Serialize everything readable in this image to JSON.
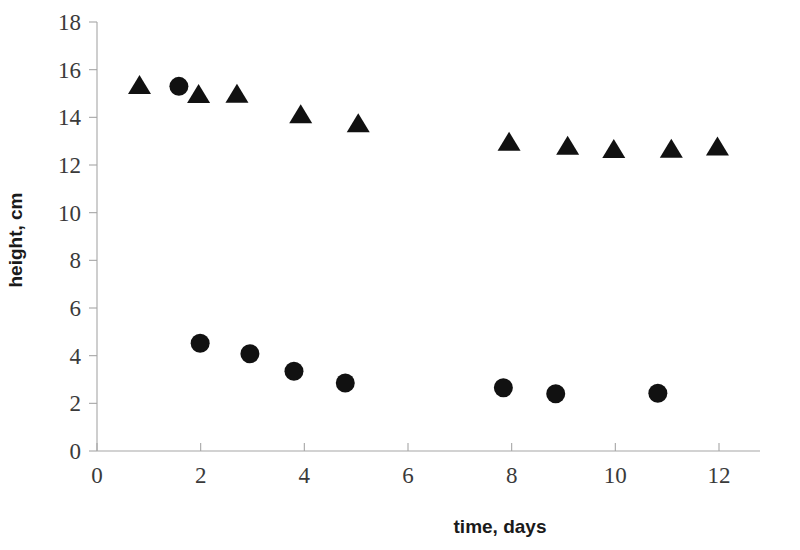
{
  "chart_data": {
    "type": "scatter",
    "title": "",
    "xlabel": "time, days",
    "ylabel": "height, cm",
    "xlim": [
      0,
      12.8
    ],
    "ylim": [
      0,
      18
    ],
    "xticks": [
      0,
      2,
      4,
      6,
      8,
      10,
      12
    ],
    "yticks": [
      0,
      2,
      4,
      6,
      8,
      10,
      12,
      14,
      16,
      18
    ],
    "xtick_labels": [
      "0",
      "2",
      "4",
      "6",
      "8",
      "10",
      "12"
    ],
    "ytick_labels": [
      "0",
      "2",
      "4",
      "6",
      "8",
      "10",
      "12",
      "14",
      "16",
      "18"
    ],
    "grid": false,
    "legend": "none",
    "marker_color": "#111111",
    "axis_color": "#a6a6a6",
    "series": [
      {
        "name": "triangles",
        "marker": "triangle",
        "color": "#111111",
        "points": [
          {
            "x": 0.82,
            "y": 15.33
          },
          {
            "x": 1.96,
            "y": 14.95
          },
          {
            "x": 2.7,
            "y": 14.96
          },
          {
            "x": 3.93,
            "y": 14.1
          },
          {
            "x": 5.04,
            "y": 13.72
          },
          {
            "x": 7.95,
            "y": 12.95
          },
          {
            "x": 9.08,
            "y": 12.78
          },
          {
            "x": 9.97,
            "y": 12.64
          },
          {
            "x": 11.08,
            "y": 12.66
          },
          {
            "x": 11.97,
            "y": 12.75
          }
        ]
      },
      {
        "name": "circles",
        "marker": "circle",
        "color": "#111111",
        "points": [
          {
            "x": 1.58,
            "y": 15.3
          },
          {
            "x": 1.99,
            "y": 4.52
          },
          {
            "x": 2.95,
            "y": 4.08
          },
          {
            "x": 3.8,
            "y": 3.35
          },
          {
            "x": 4.79,
            "y": 2.85
          },
          {
            "x": 7.84,
            "y": 2.65
          },
          {
            "x": 8.85,
            "y": 2.4
          },
          {
            "x": 10.82,
            "y": 2.42
          }
        ]
      }
    ]
  }
}
